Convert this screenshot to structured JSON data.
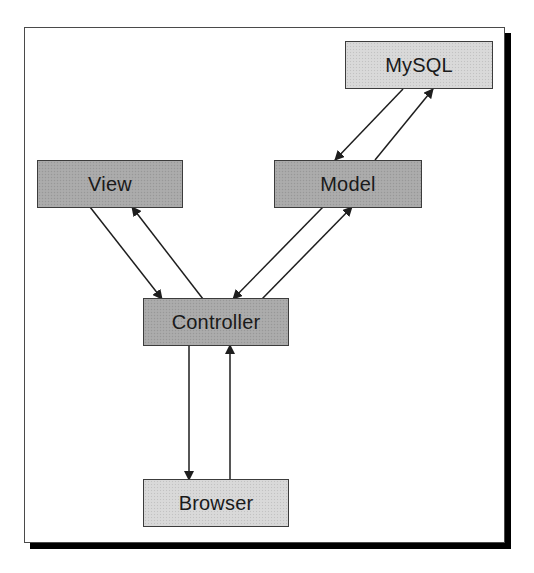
{
  "diagram": {
    "colors": {
      "dark_node": "#a9a9a9",
      "light_node": "#d8d8d8",
      "border": "#3c3c3c",
      "arrow": "#1e1e1e",
      "shadow": "#000000"
    },
    "nodes": {
      "mysql": {
        "label": "MySQL",
        "shade": "light"
      },
      "view": {
        "label": "View",
        "shade": "dark"
      },
      "model": {
        "label": "Model",
        "shade": "dark"
      },
      "controller": {
        "label": "Controller",
        "shade": "dark"
      },
      "browser": {
        "label": "Browser",
        "shade": "light"
      }
    },
    "edges": [
      {
        "from": "MySQL",
        "to": "Model"
      },
      {
        "from": "Model",
        "to": "MySQL"
      },
      {
        "from": "View",
        "to": "Controller"
      },
      {
        "from": "Controller",
        "to": "View"
      },
      {
        "from": "Model",
        "to": "Controller"
      },
      {
        "from": "Controller",
        "to": "Model"
      },
      {
        "from": "Controller",
        "to": "Browser"
      },
      {
        "from": "Browser",
        "to": "Controller"
      }
    ]
  }
}
